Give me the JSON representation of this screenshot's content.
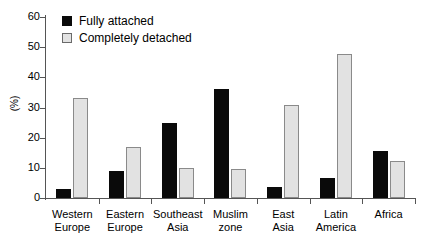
{
  "chart_data": {
    "type": "bar",
    "title": "",
    "xlabel": "",
    "ylabel": "(%)",
    "ylim": [
      0,
      60
    ],
    "yticks": [
      0,
      10,
      20,
      30,
      40,
      50,
      60
    ],
    "grid": false,
    "legend_position": "top-left",
    "categories": [
      "Western Europe",
      "Eastern Europe",
      "Southeast Asia",
      "Muslim zone",
      "East Asia",
      "Latin America",
      "Africa"
    ],
    "category_lines": [
      [
        "Western",
        "Europe"
      ],
      [
        "Eastern",
        "Europe"
      ],
      [
        "Southeast",
        "Asia"
      ],
      [
        "Muslim",
        "zone"
      ],
      [
        "East",
        "Asia"
      ],
      [
        "Latin",
        "America"
      ],
      [
        "Africa",
        ""
      ]
    ],
    "series": [
      {
        "name": "Fully attached",
        "color": "#0a0a0a",
        "values": [
          3.0,
          9.0,
          25.0,
          36.0,
          3.7,
          6.6,
          15.6
        ]
      },
      {
        "name": "Completely detached",
        "color": "#e2e2e2",
        "values": [
          33.0,
          16.8,
          9.8,
          9.7,
          30.7,
          47.7,
          12.4
        ]
      }
    ]
  },
  "legend": {
    "items": [
      {
        "label": "Fully attached",
        "swatch": "dark"
      },
      {
        "label": "Completely detached",
        "swatch": "light"
      }
    ]
  },
  "axis": {
    "y_title": "(%)"
  }
}
